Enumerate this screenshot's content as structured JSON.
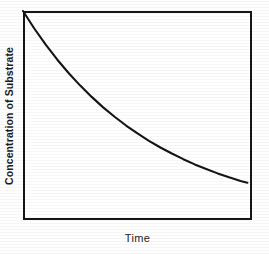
{
  "figure": {
    "background_color": "#fefefe",
    "ink_color": "#151515"
  },
  "chart_data": {
    "type": "line",
    "title": "",
    "xlabel": "Time",
    "ylabel": "Concentration of Substrate",
    "grid": false,
    "legend": null,
    "xlim": [
      0,
      1
    ],
    "ylim": [
      0,
      1
    ],
    "xticks": [],
    "yticks": [],
    "xticklabels": [],
    "yticklabels": [],
    "annotations": [],
    "series": [
      {
        "name": "Substrate concentration",
        "description": "Exponential decay of substrate concentration over time",
        "color": "#151515",
        "linewidth": 2,
        "x": [
          0.0,
          0.05,
          0.1,
          0.15,
          0.2,
          0.25,
          0.3,
          0.35,
          0.4,
          0.45,
          0.5,
          0.55,
          0.6,
          0.65,
          0.7,
          0.75,
          0.8,
          0.85,
          0.9,
          0.95,
          0.98
        ],
        "y": [
          1.0,
          0.915,
          0.838,
          0.767,
          0.702,
          0.643,
          0.589,
          0.539,
          0.494,
          0.452,
          0.414,
          0.379,
          0.347,
          0.318,
          0.291,
          0.266,
          0.244,
          0.223,
          0.204,
          0.187,
          0.178
        ]
      }
    ]
  },
  "axis_labels": {
    "y": "Concentration of Substrate",
    "x": "Time"
  }
}
